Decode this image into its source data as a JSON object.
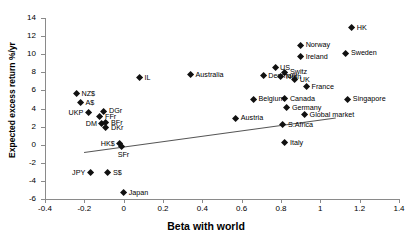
{
  "chart_data": {
    "type": "scatter",
    "title": "",
    "xlabel": "Beta with world",
    "ylabel": "Expected excess return %/yr",
    "xlim": [
      -0.4,
      1.4
    ],
    "ylim": [
      -6,
      14
    ],
    "xticks": [
      -0.4,
      -0.2,
      0,
      0.2,
      0.4,
      0.6,
      0.8,
      1,
      1.2,
      1.4
    ],
    "xtick_labels": [
      "-0.4",
      "-0.2",
      "0",
      "0.2",
      "0.4",
      "0.6",
      "0.8",
      "1",
      "1.2",
      "1.4"
    ],
    "yticks": [
      -6,
      -4,
      -2,
      0,
      2,
      4,
      6,
      8,
      10,
      12,
      14
    ],
    "ytick_labels": [
      "-6",
      "-4",
      "-2",
      "0",
      "2",
      "4",
      "6",
      "8",
      "10",
      "12",
      "14"
    ],
    "grid": false,
    "legend": "none",
    "marker": "diamond",
    "marker_color": "#111111",
    "trendline": {
      "present": true,
      "color": "#555555",
      "x_start": -0.2,
      "y_start": -0.8,
      "x_end": 1.08,
      "y_end": 3.0
    },
    "points": [
      {
        "label": "HK",
        "x": 1.16,
        "y": 12.9,
        "label_pos": "right"
      },
      {
        "label": "Norway",
        "x": 0.9,
        "y": 11.0,
        "label_pos": "right"
      },
      {
        "label": "Sweden",
        "x": 1.13,
        "y": 10.1,
        "label_pos": "right"
      },
      {
        "label": "Ireland",
        "x": 0.9,
        "y": 9.7,
        "label_pos": "right"
      },
      {
        "label": "IL",
        "x": 0.08,
        "y": 7.4,
        "label_pos": "right"
      },
      {
        "label": "Australia",
        "x": 0.34,
        "y": 7.7,
        "label_pos": "right"
      },
      {
        "label": "US",
        "x": 0.77,
        "y": 8.5,
        "label_pos": "right"
      },
      {
        "label": "Switz",
        "x": 0.82,
        "y": 8.0,
        "label_pos": "right"
      },
      {
        "label": "Denmark",
        "x": 0.71,
        "y": 7.6,
        "label_pos": "right"
      },
      {
        "label": "Neth",
        "x": 0.8,
        "y": 7.5,
        "label_pos": "right"
      },
      {
        "label": "UK",
        "x": 0.87,
        "y": 7.2,
        "label_pos": "right"
      },
      {
        "label": "France",
        "x": 0.93,
        "y": 6.4,
        "label_pos": "right"
      },
      {
        "label": "Singapore",
        "x": 1.14,
        "y": 5.0,
        "label_pos": "right"
      },
      {
        "label": "Canada",
        "x": 0.82,
        "y": 5.1,
        "label_pos": "right"
      },
      {
        "label": "Belgium",
        "x": 0.66,
        "y": 5.0,
        "label_pos": "right"
      },
      {
        "label": "Germany",
        "x": 0.83,
        "y": 4.1,
        "label_pos": "right"
      },
      {
        "label": "Global market",
        "x": 0.92,
        "y": 3.3,
        "label_pos": "right"
      },
      {
        "label": "Austria",
        "x": 0.57,
        "y": 2.9,
        "label_pos": "right"
      },
      {
        "label": "S.Africa",
        "x": 0.81,
        "y": 2.2,
        "label_pos": "right"
      },
      {
        "label": "Italy",
        "x": 0.82,
        "y": 0.2,
        "label_pos": "right"
      },
      {
        "label": "NZ$",
        "x": -0.24,
        "y": 5.6,
        "label_pos": "right"
      },
      {
        "label": "A$",
        "x": -0.22,
        "y": 4.6,
        "label_pos": "right"
      },
      {
        "label": "UKP",
        "x": -0.18,
        "y": 3.5,
        "label_pos": "left"
      },
      {
        "label": "DGr",
        "x": -0.1,
        "y": 3.7,
        "label_pos": "right"
      },
      {
        "label": "FFr",
        "x": -0.12,
        "y": 3.1,
        "label_pos": "right"
      },
      {
        "label": "DM",
        "x": -0.11,
        "y": 2.3,
        "label_pos": "left"
      },
      {
        "label": "BFr",
        "x": -0.09,
        "y": 2.4,
        "label_pos": "right"
      },
      {
        "label": "DKr",
        "x": -0.09,
        "y": 1.9,
        "label_pos": "right"
      },
      {
        "label": "HK$",
        "x": -0.02,
        "y": 0.1,
        "label_pos": "left"
      },
      {
        "label": "SFr",
        "x": -0.01,
        "y": -0.2,
        "label_pos": "below"
      },
      {
        "label": "JPY",
        "x": -0.17,
        "y": -3.1,
        "label_pos": "left"
      },
      {
        "label": "S$",
        "x": -0.08,
        "y": -3.1,
        "label_pos": "right"
      },
      {
        "label": "Japan",
        "x": 0.0,
        "y": -5.3,
        "label_pos": "right"
      }
    ]
  }
}
